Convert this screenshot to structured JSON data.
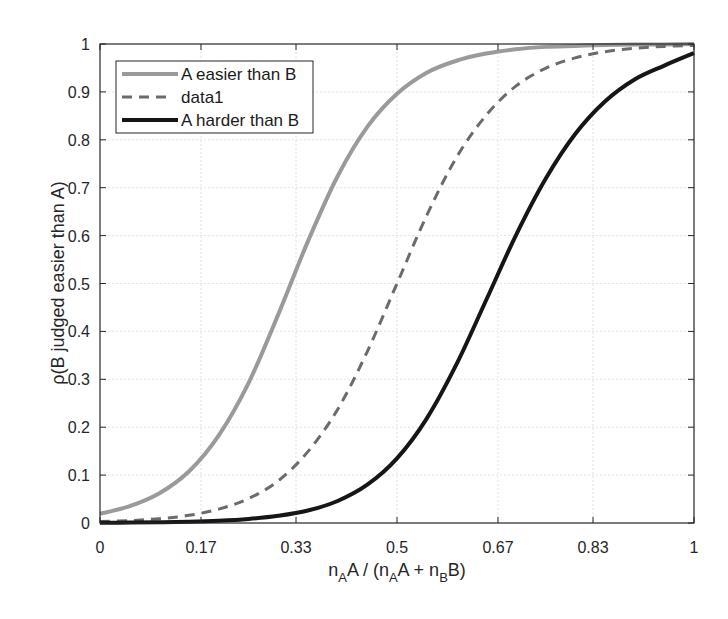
{
  "chart_data": {
    "type": "line",
    "title": "",
    "xlabel": "n_A A / (n_A A + n_B B)",
    "ylabel": "ρ(B judged easier than A)",
    "xlim": [
      0,
      1
    ],
    "ylim": [
      0,
      1
    ],
    "grid": true,
    "legend_position": "upper left",
    "x_ticks": [
      0,
      0.17,
      0.33,
      0.5,
      0.67,
      0.83,
      1
    ],
    "x_tick_labels": [
      "0",
      "0.17",
      "0.33",
      "0.5",
      "0.67",
      "0.83",
      "1"
    ],
    "y_ticks": [
      0,
      0.1,
      0.2,
      0.3,
      0.4,
      0.5,
      0.6,
      0.7,
      0.8,
      0.9,
      1
    ],
    "y_tick_labels": [
      "0",
      "0.1",
      "0.2",
      "0.3",
      "0.4",
      "0.5",
      "0.6",
      "0.7",
      "0.8",
      "0.9",
      "1"
    ],
    "x": [
      0,
      0.05,
      0.1,
      0.15,
      0.2,
      0.25,
      0.3,
      0.35,
      0.4,
      0.45,
      0.5,
      0.55,
      0.6,
      0.65,
      0.7,
      0.75,
      0.8,
      0.85,
      0.9,
      0.95,
      1
    ],
    "series": [
      {
        "name": "A easier than B",
        "color": "#9a9a9a",
        "style": "solid",
        "width": 4,
        "values": [
          0.019,
          0.035,
          0.062,
          0.108,
          0.183,
          0.292,
          0.435,
          0.588,
          0.724,
          0.827,
          0.896,
          0.94,
          0.965,
          0.98,
          0.989,
          0.994,
          0.996,
          0.998,
          0.999,
          0.999,
          1.0
        ]
      },
      {
        "name": "data1",
        "color": "#6b6b6b",
        "style": "dashed",
        "width": 3,
        "values": [
          0.003,
          0.005,
          0.009,
          0.016,
          0.029,
          0.051,
          0.088,
          0.149,
          0.237,
          0.358,
          0.5,
          0.642,
          0.763,
          0.851,
          0.912,
          0.949,
          0.971,
          0.984,
          0.991,
          0.995,
          0.997
        ]
      },
      {
        "name": "A harder than B",
        "color": "#161616",
        "style": "solid",
        "width": 4,
        "values": [
          0.0004,
          0.0008,
          0.0015,
          0.0026,
          0.0047,
          0.0084,
          0.015,
          0.026,
          0.046,
          0.08,
          0.135,
          0.218,
          0.331,
          0.465,
          0.6,
          0.718,
          0.812,
          0.88,
          0.926,
          0.955,
          0.981
        ]
      }
    ]
  },
  "axes": {
    "xlabel_parts": {
      "n1": "n",
      "sub1": "A",
      "t1": "A / (n",
      "sub2": "A",
      "t2": "A + n",
      "sub3": "B",
      "t3": "B)"
    },
    "ylabel": "ρ(B judged easier than A)"
  },
  "legend": {
    "items": [
      "A easier than B",
      "data1",
      "A harder than B"
    ]
  }
}
